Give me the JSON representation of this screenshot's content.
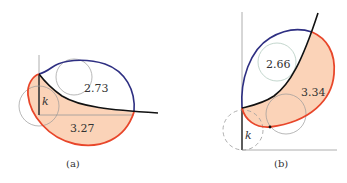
{
  "colors": {
    "fill": "#fbd3b8",
    "red_curve": "#e8462a",
    "blue_curve": "#2e2f82",
    "black_curve": "#111111",
    "axis": "#9a9a9a",
    "circle": "#9a9a9a",
    "circle_b": "#a9c4b8"
  },
  "panel_a": {
    "caption": "(a)",
    "upper_region_label": "2.73",
    "lower_region_label": "3.27",
    "k_label": "k"
  },
  "panel_b": {
    "caption": "(b)",
    "upper_region_label": "2.66",
    "lower_region_label": "3.34",
    "k_label": "k"
  }
}
